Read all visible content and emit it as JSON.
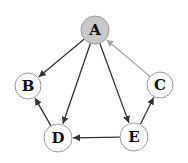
{
  "diagram": {
    "type": "directed-graph",
    "colors": {
      "edge": "#333333",
      "edge_highlight": "#a8a8a8",
      "node_stroke": "#9a9a9a",
      "node_fill": "#ffffff",
      "node_fill_highlight": "#c8c8c8",
      "label": "#111111"
    },
    "nodes": [
      {
        "id": "A",
        "label": "A",
        "x": 95,
        "y": 30,
        "r": 14,
        "highlight": true
      },
      {
        "id": "B",
        "label": "B",
        "x": 28,
        "y": 86,
        "r": 13,
        "highlight": false
      },
      {
        "id": "C",
        "label": "C",
        "x": 160,
        "y": 85,
        "r": 13,
        "highlight": false
      },
      {
        "id": "D",
        "label": "D",
        "x": 58,
        "y": 138,
        "r": 14,
        "highlight": false
      },
      {
        "id": "E",
        "label": "E",
        "x": 134,
        "y": 137,
        "r": 14,
        "highlight": false
      }
    ],
    "edges": [
      {
        "from": "A",
        "to": "B",
        "highlight": false
      },
      {
        "from": "A",
        "to": "D",
        "highlight": false
      },
      {
        "from": "A",
        "to": "E",
        "highlight": false
      },
      {
        "from": "C",
        "to": "A",
        "highlight": true
      },
      {
        "from": "D",
        "to": "B",
        "highlight": false
      },
      {
        "from": "E",
        "to": "D",
        "highlight": false
      },
      {
        "from": "E",
        "to": "C",
        "highlight": false
      }
    ]
  }
}
